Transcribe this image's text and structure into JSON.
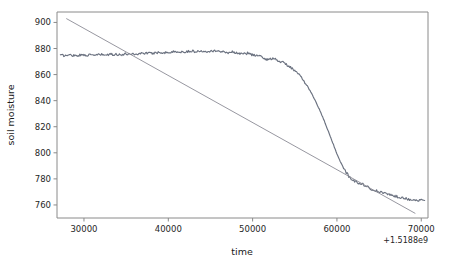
{
  "chart_data": {
    "type": "line",
    "title": "",
    "xlabel": "time",
    "ylabel": "soil moisture",
    "x_offset_label": "+1.5188e9",
    "xlim": [
      26800,
      70800
    ],
    "ylim": [
      750,
      908
    ],
    "xticks": [
      30000,
      40000,
      50000,
      60000,
      70000
    ],
    "xtick_labels": [
      "30000",
      "40000",
      "50000",
      "60000",
      "70000"
    ],
    "yticks": [
      760,
      780,
      800,
      820,
      840,
      860,
      880,
      900
    ],
    "ytick_labels": [
      "760",
      "780",
      "800",
      "820",
      "840",
      "860",
      "880",
      "900"
    ],
    "grid": false,
    "legend": null,
    "series": [
      {
        "name": "soil moisture",
        "color": "#6b7280",
        "style": "noisy-line",
        "x": [
          27200,
          27800,
          28400,
          29000,
          29600,
          30200,
          30800,
          31400,
          32000,
          32600,
          33200,
          33800,
          34400,
          35000,
          35600,
          36200,
          36800,
          37400,
          38000,
          38600,
          39200,
          39800,
          40400,
          41000,
          41600,
          42200,
          42800,
          43400,
          44000,
          44600,
          45200,
          45800,
          46400,
          47000,
          47600,
          48200,
          48800,
          49400,
          50000,
          50600,
          51200,
          51800,
          52400,
          53000,
          53600,
          54200,
          54800,
          55400,
          56000,
          56600,
          57200,
          57800,
          58400,
          59000,
          59600,
          60200,
          60800,
          61400,
          62000,
          62600,
          63200,
          63800,
          64400,
          65000,
          65600,
          66200,
          66800,
          67400,
          68000,
          68600,
          69200,
          69800,
          70400
        ],
        "y": [
          874.8,
          874.6,
          875.0,
          874.7,
          874.9,
          875.2,
          874.8,
          875.1,
          875.3,
          875.0,
          875.4,
          875.6,
          875.2,
          875.8,
          876.0,
          875.7,
          876.3,
          876.6,
          876.2,
          876.9,
          877.1,
          876.8,
          877.3,
          877.6,
          877.2,
          877.8,
          878.0,
          877.6,
          878.2,
          877.9,
          878.4,
          878.1,
          877.5,
          876.9,
          877.4,
          876.6,
          875.8,
          876.4,
          875.2,
          874.6,
          873.0,
          871.4,
          872.6,
          871.0,
          869.2,
          867.0,
          864.0,
          860.5,
          856.0,
          850.0,
          843.0,
          835.0,
          826.0,
          816.0,
          806.0,
          796.0,
          788.0,
          782.0,
          778.5,
          777.0,
          775.5,
          773.0,
          771.5,
          770.0,
          769.0,
          768.0,
          767.0,
          766.0,
          765.2,
          764.4,
          763.8,
          763.5,
          763.4
        ]
      },
      {
        "name": "linear fit",
        "color": "#8b8b95",
        "style": "straight-line",
        "x": [
          27900,
          69300
        ],
        "y": [
          903.0,
          753.5
        ]
      }
    ]
  },
  "axes": {
    "x_axis_name": "time-axis",
    "y_axis_name": "soil-moisture-axis"
  }
}
